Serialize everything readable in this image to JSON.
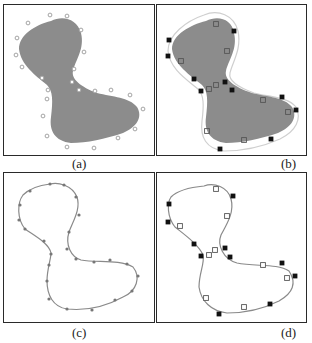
{
  "figure": {
    "colors": {
      "frame": "#2a2a2a",
      "shape_fill": "#8c8c8c",
      "curve": "#8a8a8a",
      "offset_curve": "#cfcfcf",
      "circle_marker": "#9a9a9a",
      "dot_marker": "#777777",
      "filled_square": "#111111",
      "hollow_square": "#555555"
    },
    "panels": [
      {
        "id": "a",
        "caption": "(a)",
        "description": "Filled gray dumbbell-shaped region surrounded by small hollow circle sample points",
        "show_fill": true,
        "show_curve": false,
        "show_offset": false,
        "circles": [
          [
            49,
            14
          ],
          [
            66,
            15
          ],
          [
            27,
            22
          ],
          [
            16,
            37
          ],
          [
            80,
            29
          ],
          [
            15,
            54
          ],
          [
            83,
            51
          ],
          [
            21,
            66
          ],
          [
            73,
            68
          ],
          [
            41,
            77
          ],
          [
            71,
            81
          ],
          [
            47,
            89
          ],
          [
            78,
            89
          ],
          [
            94,
            90
          ],
          [
            110,
            89
          ],
          [
            46,
            98
          ],
          [
            129,
            94
          ],
          [
            142,
            108
          ],
          [
            42,
            115
          ],
          [
            134,
            128
          ],
          [
            46,
            135
          ],
          [
            117,
            137
          ],
          [
            66,
            146
          ],
          [
            93,
            147
          ]
        ]
      },
      {
        "id": "b",
        "caption": "(b)",
        "description": "Filled region with offset contour; filled and hollow square control points",
        "show_fill": true,
        "show_curve": false,
        "show_offset": true,
        "filled_squares": [
          [
            168,
            39
          ],
          [
            167,
            55
          ],
          [
            233,
            30
          ],
          [
            193,
            78
          ],
          [
            200,
            90
          ],
          [
            224,
            81
          ],
          [
            231,
            89
          ],
          [
            281,
            96
          ],
          [
            295,
            109
          ],
          [
            270,
            138
          ],
          [
            219,
            148
          ]
        ],
        "hollow_squares": [
          [
            215,
            23
          ],
          [
            226,
            50
          ],
          [
            180,
            60
          ],
          [
            208,
            88
          ],
          [
            215,
            84
          ],
          [
            262,
            99
          ],
          [
            287,
            111
          ],
          [
            206,
            130
          ],
          [
            243,
            139
          ]
        ]
      },
      {
        "id": "c",
        "caption": "(c)",
        "description": "Closed curve through small dot sample points",
        "show_fill": false,
        "show_curve": true,
        "show_offset": false,
        "dots": [
          [
            49,
            183
          ],
          [
            63,
            184
          ],
          [
            29,
            190
          ],
          [
            19,
            204
          ],
          [
            75,
            196
          ],
          [
            18,
            219
          ],
          [
            78,
            214
          ],
          [
            24,
            228
          ],
          [
            68,
            231
          ],
          [
            43,
            240
          ],
          [
            66,
            248
          ],
          [
            50,
            253
          ],
          [
            75,
            258
          ],
          [
            93,
            261
          ],
          [
            109,
            259
          ],
          [
            48,
            264
          ],
          [
            126,
            263
          ],
          [
            137,
            275
          ],
          [
            46,
            280
          ],
          [
            131,
            290
          ],
          [
            48,
            298
          ],
          [
            114,
            299
          ],
          [
            66,
            308
          ],
          [
            91,
            309
          ]
        ]
      },
      {
        "id": "d",
        "caption": "(d)",
        "description": "Closed curve with filled and hollow square control points",
        "show_fill": false,
        "show_curve": true,
        "show_offset": false,
        "filled_squares": [
          [
            168,
            203
          ],
          [
            167,
            221
          ],
          [
            232,
            195
          ],
          [
            193,
            243
          ],
          [
            200,
            255
          ],
          [
            224,
            247
          ],
          [
            229,
            256
          ],
          [
            281,
            262
          ],
          [
            294,
            275
          ],
          [
            269,
            303
          ],
          [
            218,
            313
          ]
        ],
        "hollow_squares": [
          [
            215,
            188
          ],
          [
            226,
            215
          ],
          [
            179,
            225
          ],
          [
            208,
            254
          ],
          [
            214,
            249
          ],
          [
            262,
            264
          ],
          [
            286,
            277
          ],
          [
            205,
            297
          ],
          [
            243,
            306
          ]
        ]
      }
    ]
  }
}
